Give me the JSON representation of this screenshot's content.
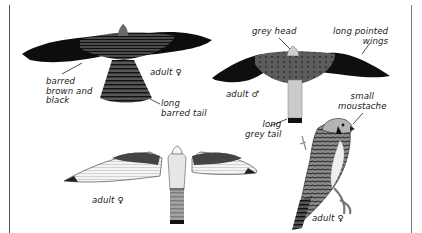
{
  "figure": {
    "colors": {
      "ink": "#1a1a1a",
      "wing_dark": "#0e0e0e",
      "mantle_barred": "#3a3a3a",
      "male_back": "#5a5a5a",
      "grey_tail": "#c8c8c8",
      "pale_underwing": "#f2f2f2"
    },
    "birds": [
      {
        "id": "female-upperside-flight",
        "label": "adult ♀",
        "annotations": [
          "barred\nbrown and\nblack",
          "long\nbarred tail"
        ]
      },
      {
        "id": "male-upperside-flight",
        "label": "adult ♂",
        "annotations": [
          "grey head",
          "long pointed\nwings",
          "long\ngrey tail"
        ]
      },
      {
        "id": "female-underside-flight",
        "label": "adult ♀",
        "annotations": []
      },
      {
        "id": "female-perched",
        "label": "adult ♀",
        "annotations": [
          "small\nmoustache"
        ]
      }
    ]
  }
}
